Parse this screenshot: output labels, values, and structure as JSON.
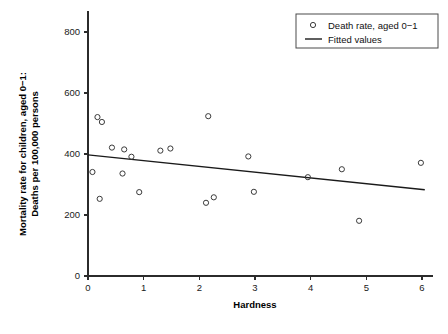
{
  "chart_data": {
    "type": "scatter",
    "title": "",
    "xlabel": "Hardness",
    "ylabel_line1": "Mortality rate for children, aged 0−1:",
    "ylabel_line2": "Deaths per 100,000 persons",
    "xlim": [
      0,
      6.2
    ],
    "ylim": [
      0,
      850
    ],
    "xticks": [
      0,
      1,
      2,
      3,
      4,
      5,
      6
    ],
    "xtick_labels": [
      "0",
      "1",
      "2",
      "3",
      "4",
      "5",
      "6"
    ],
    "yticks": [
      0,
      200,
      400,
      600,
      800
    ],
    "ytick_labels": [
      "0",
      "200",
      "400",
      "600",
      "800"
    ],
    "grid": false,
    "legend_position": "top-right",
    "legend": [
      {
        "label": "Death rate, aged 0−1",
        "marker": "circle-open"
      },
      {
        "label": "Fitted values",
        "marker": "line"
      }
    ],
    "series": [
      {
        "name": "Death rate, aged 0−1",
        "marker": "circle-open",
        "color": "#3a3a3a",
        "points": [
          {
            "x": 0.08,
            "y": 341
          },
          {
            "x": 0.17,
            "y": 521
          },
          {
            "x": 0.21,
            "y": 253
          },
          {
            "x": 0.25,
            "y": 505
          },
          {
            "x": 0.43,
            "y": 421
          },
          {
            "x": 0.62,
            "y": 336
          },
          {
            "x": 0.65,
            "y": 415
          },
          {
            "x": 0.78,
            "y": 391
          },
          {
            "x": 0.92,
            "y": 275
          },
          {
            "x": 1.3,
            "y": 411
          },
          {
            "x": 1.48,
            "y": 418
          },
          {
            "x": 2.12,
            "y": 240
          },
          {
            "x": 2.16,
            "y": 524
          },
          {
            "x": 2.26,
            "y": 258
          },
          {
            "x": 2.88,
            "y": 392
          },
          {
            "x": 2.98,
            "y": 276
          },
          {
            "x": 3.95,
            "y": 324
          },
          {
            "x": 4.56,
            "y": 350
          },
          {
            "x": 4.87,
            "y": 181
          },
          {
            "x": 5.98,
            "y": 371
          }
        ]
      }
    ],
    "fitted_line": {
      "name": "Fitted values",
      "color": "#1a1a1a",
      "x_start": 0.0,
      "y_start": 397,
      "x_end": 6.05,
      "y_end": 283
    }
  }
}
